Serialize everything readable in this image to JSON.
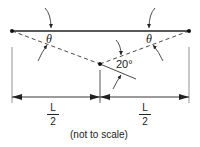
{
  "labels": {
    "theta_left": "θ",
    "theta_right": "θ",
    "angle": "20°",
    "half_left_num": "L",
    "half_left_den": "2",
    "half_right_num": "L",
    "half_right_den": "2",
    "note": "(not to scale)"
  },
  "colors": {
    "line": "#222222",
    "ext": "#888888"
  }
}
